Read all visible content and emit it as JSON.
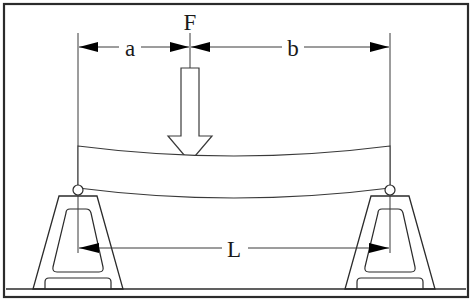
{
  "figure": {
    "background_color": "#ffffff",
    "line_color": "#2b2b2b",
    "frame": {
      "name": "outer-border",
      "x": 3,
      "y": 3,
      "width": 466,
      "height": 295
    }
  },
  "labels": {
    "force": "F",
    "distance_a": "a",
    "distance_b": "b",
    "span_L": "L"
  },
  "geometry": {
    "left_support_x": 78,
    "right_support_x": 390,
    "load_center_x": 190,
    "dimension_line_y": 47,
    "span_line_y": 248,
    "ground_y": 289,
    "beam_top_y": 146,
    "beam_bottom_y": 188
  },
  "annotations": {
    "force_arrow": "hollow-block-arrow-down",
    "left_support": "roller-support-trapezoid",
    "right_support": "roller-support-trapezoid",
    "beam": "deflected-sagging-beam",
    "dimension_a_description": "distance from left support to load point",
    "dimension_b_description": "distance from load point to right support",
    "dimension_L_description": "total span between supports"
  }
}
